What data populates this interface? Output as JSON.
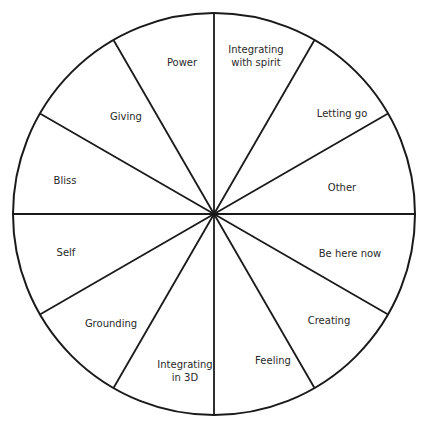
{
  "wheel": {
    "center": [
      214,
      214
    ],
    "radius": 201,
    "stroke_color": "#1a1a1a",
    "segments": [
      {
        "label_lines": [
          "Power"
        ],
        "pos": [
          182,
          62
        ]
      },
      {
        "label_lines": [
          "Integrating",
          "with spirit"
        ],
        "pos": [
          256,
          56
        ]
      },
      {
        "label_lines": [
          "Letting go"
        ],
        "pos": [
          342,
          113
        ]
      },
      {
        "label_lines": [
          "Other"
        ],
        "pos": [
          342,
          187
        ]
      },
      {
        "label_lines": [
          "Be here now"
        ],
        "pos": [
          350,
          253
        ]
      },
      {
        "label_lines": [
          "Creating"
        ],
        "pos": [
          329,
          320
        ]
      },
      {
        "label_lines": [
          "Feeling"
        ],
        "pos": [
          273,
          360
        ]
      },
      {
        "label_lines": [
          "Integrating",
          "in 3D"
        ],
        "pos": [
          185,
          371
        ]
      },
      {
        "label_lines": [
          "Grounding"
        ],
        "pos": [
          111,
          323
        ]
      },
      {
        "label_lines": [
          "Self"
        ],
        "pos": [
          66,
          252
        ]
      },
      {
        "label_lines": [
          "Bliss"
        ],
        "pos": [
          65,
          180
        ]
      },
      {
        "label_lines": [
          "Giving"
        ],
        "pos": [
          126,
          116
        ]
      }
    ]
  }
}
